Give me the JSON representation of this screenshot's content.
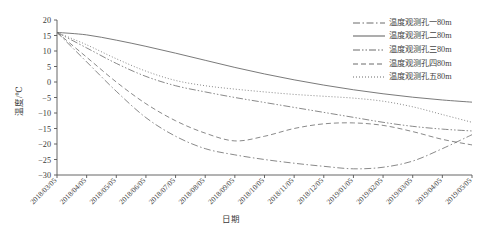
{
  "chart_data": {
    "type": "line",
    "title": "",
    "xlabel": "日期",
    "ylabel": "温度/℃",
    "ylim": [
      -30,
      20
    ],
    "yticks": [
      20,
      15,
      10,
      5,
      0,
      -5,
      -10,
      -15,
      -20,
      -25,
      -30
    ],
    "grid": false,
    "legend_position": "top-right",
    "categories": [
      "2018/03/05",
      "2018/04/05",
      "2018/05/05",
      "2018/06/05",
      "2018/07/05",
      "2018/08/05",
      "2018/09/05",
      "2018/10/05",
      "2018/11/05",
      "2018/12/05",
      "2019/01/05",
      "2019/02/05",
      "2019/03/05",
      "2019/04/05",
      "2019/05/05"
    ],
    "series": [
      {
        "name": "温度观测孔一80m",
        "style": "dash-dot",
        "values": [
          16.0,
          6.5,
          -3.0,
          -11.5,
          -17.5,
          -21.5,
          -23.5,
          -25.0,
          -26.2,
          -27.2,
          -28.0,
          -27.5,
          -25.5,
          -21.5,
          -17.0
        ]
      },
      {
        "name": "温度观测孔二80m",
        "style": "solid",
        "values": [
          16.0,
          15.2,
          13.5,
          11.5,
          9.3,
          7.0,
          4.7,
          2.6,
          0.7,
          -1.0,
          -2.5,
          -3.8,
          -4.9,
          -5.8,
          -6.5
        ]
      },
      {
        "name": "温度观测孔三80m",
        "style": "dash-dot-dot",
        "values": [
          16.0,
          11.0,
          6.0,
          1.8,
          -1.2,
          -3.2,
          -5.0,
          -6.6,
          -8.2,
          -9.8,
          -11.4,
          -13.0,
          -14.3,
          -15.2,
          -15.8
        ]
      },
      {
        "name": "温度观测孔四80m",
        "style": "dashed",
        "values": [
          16.0,
          8.0,
          0.0,
          -7.0,
          -12.5,
          -16.5,
          -19.0,
          -17.5,
          -15.0,
          -13.5,
          -13.2,
          -14.0,
          -16.0,
          -18.5,
          -20.3
        ]
      },
      {
        "name": "温度观测孔五80m",
        "style": "dotted",
        "values": [
          16.0,
          12.0,
          7.5,
          3.5,
          0.5,
          -1.2,
          -2.3,
          -3.2,
          -4.0,
          -4.6,
          -5.2,
          -6.2,
          -8.0,
          -10.5,
          -13.0
        ]
      }
    ]
  },
  "legend": {
    "items": [
      {
        "label": "温度观测孔一80m",
        "style": "dash-dot"
      },
      {
        "label": "温度观测孔二80m",
        "style": "solid"
      },
      {
        "label": "温度观测孔三80m",
        "style": "dash-dot-dot"
      },
      {
        "label": "温度观测孔四80m",
        "style": "dashed"
      },
      {
        "label": "温度观测孔五80m",
        "style": "dotted"
      }
    ]
  },
  "axes": {
    "y_title": "温度/℃",
    "x_title": "日期"
  },
  "colors": {
    "line": "#6b6b6b",
    "axis": "#555555",
    "text": "#3a3a3a"
  }
}
